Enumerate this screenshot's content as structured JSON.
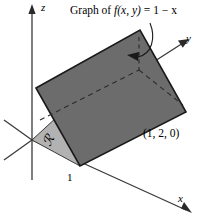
{
  "figure": {
    "caption": {
      "prefix": "Graph of ",
      "function": "f(x, y)",
      "equals": " = 1 − x",
      "full": "Graph of f(x, y) = 1 − x"
    },
    "point_label": "(1, 2, 0)",
    "region_label": "ℛ",
    "tick_label": "1",
    "axes": {
      "z": "z",
      "y": "y",
      "x": "x"
    },
    "colors": {
      "background": "#ffffff",
      "plane_fill": "#6c6c6c",
      "plane_stroke": "#1a1a1a",
      "region_fill": "#b2b2b2",
      "region_stroke": "#2a2a2a",
      "axis_stroke": "#3a3a3a",
      "dashed_stroke": "#2b2b2b",
      "text": "#000000"
    },
    "geometry": {
      "origin": [
        32,
        140
      ],
      "plane_corners": {
        "left": [
          36,
          88
        ],
        "top": [
          140,
          30
        ],
        "right": [
          186,
          112
        ],
        "bottom": [
          80,
          166
        ]
      },
      "region_corners": {
        "origin": [
          32,
          140
        ],
        "bottom": [
          80,
          166
        ],
        "edge": [
          58,
          130
        ]
      }
    }
  }
}
